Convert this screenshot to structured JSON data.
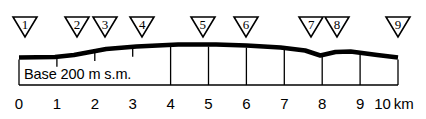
{
  "figure": {
    "base_label": "Base 200 m s.m.",
    "unit_label": "km",
    "colors": {
      "ink": "#000000",
      "paper": "#ffffff"
    }
  },
  "axis": {
    "tick_labels": [
      "0",
      "1",
      "2",
      "3",
      "4",
      "5",
      "6",
      "7",
      "8",
      "9",
      "10"
    ],
    "x_start_px": 19,
    "x_end_px": 398,
    "px_per_unit": 37.9,
    "unit": "km",
    "range": [
      0,
      10
    ]
  },
  "markers": [
    {
      "label": "1",
      "x_km": 0.16
    },
    {
      "label": "2",
      "x_km": 1.53
    },
    {
      "label": "3",
      "x_km": 2.27
    },
    {
      "label": "4",
      "x_km": 3.25
    },
    {
      "label": "5",
      "x_km": 4.85
    },
    {
      "label": "6",
      "x_km": 5.99
    },
    {
      "label": "7",
      "x_km": 7.71
    },
    {
      "label": "8",
      "x_km": 8.39
    },
    {
      "label": "9",
      "x_km": 10.0
    }
  ],
  "chart_data": {
    "type": "line",
    "xlabel": "km",
    "ylabel": "Base 200 m s.m.",
    "xlim": [
      0,
      10
    ],
    "grid": true,
    "legend": null,
    "series": [
      {
        "name": "terrain-profile",
        "x": [
          0.0,
          0.95,
          1.45,
          2.3,
          3.1,
          4.2,
          5.2,
          6.0,
          6.9,
          7.55,
          7.95,
          8.35,
          8.75,
          9.45,
          10.0
        ],
        "y_px": [
          57.5,
          57.0,
          55.0,
          49.0,
          46.5,
          44.5,
          44.5,
          45.5,
          47.5,
          50.5,
          55.5,
          52.0,
          51.5,
          55.0,
          57.5
        ]
      }
    ]
  },
  "grid": {
    "box_left_px": 19,
    "box_right_px": 398,
    "box_bottom_px": 85,
    "short_tick_x_km": [
      1,
      2,
      3
    ],
    "full_line_x_km": [
      4,
      5,
      6,
      7,
      8,
      9,
      10
    ]
  }
}
